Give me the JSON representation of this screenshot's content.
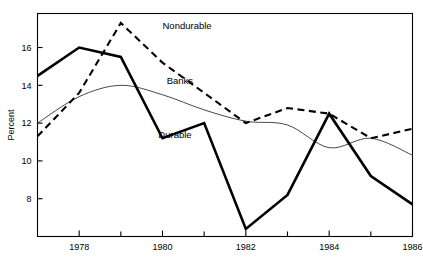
{
  "chart_data": {
    "type": "line",
    "title": "",
    "subtitle": "",
    "xlabel": "",
    "ylabel": "Percent",
    "x": [
      1977,
      1978,
      1979,
      1980,
      1981,
      1982,
      1983,
      1984,
      1985,
      1986
    ],
    "xlim": [
      1977,
      1986
    ],
    "ylim": [
      6.0,
      17.8
    ],
    "xticks_major": [
      1978,
      1980,
      1982,
      1984,
      1986
    ],
    "xticks_minor": [
      1977,
      1979,
      1981,
      1983,
      1985
    ],
    "xtick_labels": [
      "1978",
      "1980",
      "1982",
      "1984",
      "1986"
    ],
    "yticks": [
      8,
      10,
      12,
      14,
      16
    ],
    "ytick_labels": [
      "8",
      "10",
      "12",
      "14",
      "16"
    ],
    "grid": false,
    "legend_position": "inline-annotations",
    "series": [
      {
        "name": "Durable",
        "style": "thick-solid",
        "color": "#000000",
        "values": [
          14.5,
          16.0,
          15.5,
          11.2,
          12.0,
          6.4,
          8.2,
          12.5,
          9.2,
          7.7
        ]
      },
      {
        "name": "Nondurable",
        "style": "dashed",
        "color": "#000000",
        "values": [
          11.3,
          13.6,
          17.3,
          15.2,
          13.6,
          12.0,
          12.8,
          12.5,
          11.2,
          11.7
        ]
      },
      {
        "name": "Banks",
        "style": "thin-solid",
        "color": "#333333",
        "values": [
          12.0,
          13.4,
          14.0,
          13.5,
          12.7,
          12.1,
          11.9,
          10.7,
          11.2,
          10.3
        ]
      }
    ],
    "annotations": [
      {
        "text": "Nondurable",
        "x": 1980.0,
        "y": 17.0
      },
      {
        "text": "Banks",
        "x": 1980.1,
        "y": 14.05
      },
      {
        "text": "Durable",
        "x": 1979.9,
        "y": 11.2
      }
    ]
  },
  "axis": {
    "ylabel": "Percent",
    "ytick_labels": [
      "16",
      "14",
      "12",
      "10",
      "8"
    ],
    "xtick_labels": [
      "1978",
      "1980",
      "1982",
      "1984",
      "1986"
    ]
  },
  "labels": {
    "nondurable": "Nondurable",
    "banks": "Banks",
    "durable": "Durable"
  },
  "colors": {
    "durable": "#000000",
    "nondurable": "#000000",
    "banks": "#333333",
    "axis": "#000000",
    "background": "#ffffff"
  }
}
